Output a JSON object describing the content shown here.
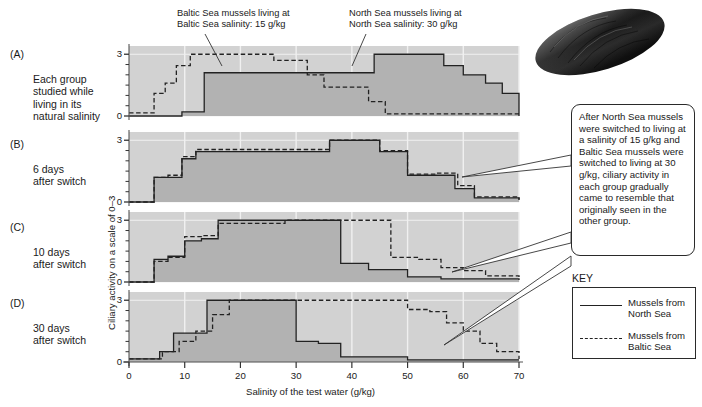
{
  "figure": {
    "xlabel": "Salinity of the test water (g/kg)",
    "ylabel": "Ciliary activity on a scale of 0–3"
  },
  "panels": [
    {
      "tag": "(A)",
      "caption": "Each group\nstudied while\nliving in its\nnatural salinity"
    },
    {
      "tag": "(B)",
      "caption": "6 days\nafter switch"
    },
    {
      "tag": "(C)",
      "caption": "10 days\nafter switch"
    },
    {
      "tag": "(D)",
      "caption": "30 days\nafter switch"
    }
  ],
  "annotations": {
    "baltic_top": "Baltic Sea mussels living at\nBaltic Sea salinity: 15 g/kg",
    "north_top": "North Sea mussels living at\nNorth Sea salinity: 30 g/kg",
    "callout": "After North Sea mussels were switched to living at a salinity of 15 g/kg and Baltic Sea mussels were switched to living at 30 g/kg, ciliary activity in each group gradually came to resemble that originally seen in the other group."
  },
  "key": {
    "title": "KEY",
    "entries": [
      {
        "label": "Mussels from\nNorth Sea",
        "style": "solid"
      },
      {
        "label": "Mussels from\nBaltic Sea",
        "style": "dashed"
      }
    ]
  },
  "photo": {
    "caption": "mussel-shell-photo"
  },
  "colors": {
    "plot_background": "#d2d2d2",
    "area_fill": "#b2b2b2",
    "line": "#222222",
    "gridline": "#f0f0f0",
    "axis": "#555555"
  },
  "chart_data": {
    "type": "line",
    "title": "",
    "xlabel": "Salinity of the test water (g/kg)",
    "ylabel": "Ciliary activity on a scale of 0–3",
    "xlim": [
      0,
      70
    ],
    "ylim": [
      0,
      3.4
    ],
    "xticks": [
      0,
      10,
      20,
      30,
      40,
      50,
      60,
      70
    ],
    "yticks": [
      0,
      3
    ],
    "grid": true,
    "legend_position": "right",
    "panels": [
      {
        "tag": "(A)",
        "caption": "Each group studied while living in its natural salinity",
        "series": [
          {
            "name": "Mussels from North Sea",
            "style": "solid",
            "x": [
              0,
              6,
              9.5,
              11.5,
              13.5,
              41,
              44,
              48,
              52,
              56.5,
              60,
              64,
              67,
              70
            ],
            "values": [
              0,
              0,
              0.2,
              0.2,
              2.1,
              2.1,
              3.0,
              3.0,
              3.0,
              2.45,
              2.0,
              1.6,
              1.1,
              0
            ]
          },
          {
            "name": "Mussels from Baltic Sea",
            "style": "dashed",
            "x": [
              0,
              2.5,
              4.5,
              6.5,
              8.5,
              11,
              23,
              26,
              29,
              32,
              35,
              38.5,
              43,
              46,
              70
            ],
            "values": [
              0.15,
              0.15,
              1.1,
              1.6,
              2.45,
              3.0,
              3.0,
              2.7,
              2.7,
              2.0,
              1.4,
              1.4,
              0.7,
              0.1,
              0.1
            ]
          }
        ]
      },
      {
        "tag": "(B)",
        "caption": "6 days after switch",
        "series": [
          {
            "name": "Mussels from North Sea",
            "style": "solid",
            "x": [
              0,
              4.5,
              7,
              9.5,
              12,
              20,
              36,
              41,
              45,
              50,
              55,
              58.5,
              62,
              70
            ],
            "values": [
              0,
              1.2,
              1.2,
              2.1,
              2.45,
              2.45,
              3.0,
              3.0,
              2.45,
              1.3,
              1.3,
              0.65,
              0.2,
              0.1
            ]
          },
          {
            "name": "Mussels from Baltic Sea",
            "style": "dashed",
            "x": [
              0,
              4.5,
              7,
              9.5,
              12,
              20,
              36,
              41,
              45,
              50,
              55,
              59,
              62,
              70
            ],
            "values": [
              0,
              1.2,
              1.3,
              2.2,
              2.55,
              2.55,
              3.0,
              3.0,
              2.5,
              1.35,
              1.4,
              0.8,
              0.25,
              0.12
            ]
          }
        ]
      },
      {
        "tag": "(C)",
        "caption": "10 days after switch",
        "series": [
          {
            "name": "Mussels from North Sea",
            "style": "solid",
            "x": [
              0,
              4.5,
              7,
              10,
              13,
              16,
              33,
              38,
              43,
              50,
              56,
              70
            ],
            "values": [
              0,
              1.1,
              1.25,
              2.0,
              2.1,
              3.0,
              3.0,
              0.9,
              0.6,
              0.25,
              0.15,
              0.1
            ]
          },
          {
            "name": "Mussels from Baltic Sea",
            "style": "dashed",
            "x": [
              0,
              4.5,
              7,
              10,
              13,
              16,
              28,
              44,
              47,
              52,
              56,
              60,
              64,
              70
            ],
            "values": [
              0,
              1.0,
              1.2,
              2.2,
              2.25,
              2.85,
              3.0,
              3.0,
              1.2,
              1.1,
              0.7,
              0.55,
              0.3,
              0.2
            ]
          }
        ]
      },
      {
        "tag": "(D)",
        "caption": "30 days after switch",
        "series": [
          {
            "name": "Mussels from North Sea",
            "style": "solid",
            "x": [
              0,
              3,
              5.5,
              8,
              11,
              14,
              26,
              30,
              34,
              38,
              43,
              50,
              70
            ],
            "values": [
              0.15,
              0.15,
              0.5,
              1.4,
              1.4,
              3.0,
              3.0,
              1.0,
              0.9,
              0.25,
              0.25,
              0.1,
              0.1
            ]
          },
          {
            "name": "Mussels from Baltic Sea",
            "style": "dashed",
            "x": [
              0,
              3,
              6,
              9,
              12,
              15,
              18,
              46,
              50,
              54,
              57,
              60,
              63,
              66,
              70
            ],
            "values": [
              0.15,
              0.15,
              0.5,
              1.0,
              1.5,
              2.3,
              3.0,
              3.0,
              2.55,
              2.45,
              1.9,
              1.5,
              0.9,
              0.5,
              0.15
            ]
          }
        ]
      }
    ]
  }
}
